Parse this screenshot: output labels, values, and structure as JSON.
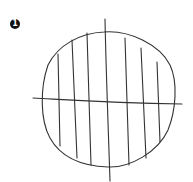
{
  "figure": {
    "label": "1",
    "stroke_color": "#333333",
    "background_color": "#ffffff"
  }
}
